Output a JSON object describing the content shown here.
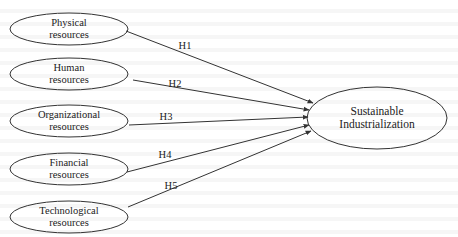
{
  "diagram": {
    "type": "conceptual-model",
    "colors": {
      "stroke": "#333333",
      "text": "#222222",
      "background": "#ffffff"
    },
    "sources": [
      {
        "id": "physical",
        "line1": "Physical",
        "line2": "resources",
        "cx": 69,
        "cy": 29,
        "rx": 59,
        "ry": 16
      },
      {
        "id": "human",
        "line1": "Human",
        "line2": "resources",
        "cx": 69,
        "cy": 74,
        "rx": 59,
        "ry": 16
      },
      {
        "id": "organizational",
        "line1": "Organizational",
        "line2": "resources",
        "cx": 69,
        "cy": 121,
        "rx": 59,
        "ry": 16
      },
      {
        "id": "financial",
        "line1": "Financial",
        "line2": "resources",
        "cx": 69,
        "cy": 169,
        "rx": 59,
        "ry": 16
      },
      {
        "id": "technological",
        "line1": "Technological",
        "line2": "resources",
        "cx": 69,
        "cy": 217,
        "rx": 59,
        "ry": 16
      }
    ],
    "target": {
      "id": "sustainable-industrialization",
      "line1": "Sustainable",
      "line2": "Industrialization",
      "cx": 377,
      "cy": 118,
      "rx": 70,
      "ry": 31
    },
    "edges": [
      {
        "label": "H1",
        "from": "physical",
        "x1": 126,
        "y1": 31,
        "x2": 313,
        "y2": 103,
        "lx": 185,
        "ly": 45
      },
      {
        "label": "H2",
        "from": "human",
        "x1": 133,
        "y1": 80,
        "x2": 309,
        "y2": 110,
        "lx": 175,
        "ly": 83
      },
      {
        "label": "H3",
        "from": "organizational",
        "x1": 129,
        "y1": 125,
        "x2": 308,
        "y2": 117,
        "lx": 166,
        "ly": 116
      },
      {
        "label": "H4",
        "from": "financial",
        "x1": 127,
        "y1": 172,
        "x2": 309,
        "y2": 125,
        "lx": 165,
        "ly": 154
      },
      {
        "label": "H5",
        "from": "technological",
        "x1": 128,
        "y1": 207,
        "x2": 311,
        "y2": 131,
        "lx": 171,
        "ly": 185
      }
    ]
  }
}
